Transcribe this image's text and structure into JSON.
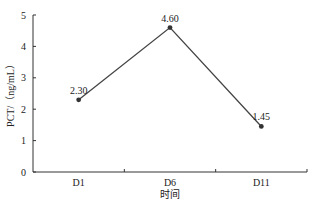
{
  "chart_data": {
    "type": "line",
    "title": "",
    "xlabel": "时间",
    "ylabel": "PCT/（ng/mL）",
    "categories": [
      "D1",
      "D6",
      "D11"
    ],
    "series": [
      {
        "name": "PCT",
        "values": [
          2.3,
          4.6,
          1.45
        ],
        "labels": [
          "2.30",
          "4.60",
          "1.45"
        ],
        "color": "#444444"
      }
    ],
    "ylim": [
      0,
      5
    ],
    "yticks": [
      0,
      1,
      2,
      3,
      4,
      5
    ],
    "ytick_labels": [
      "0",
      "1",
      "2",
      "3",
      "4",
      "5"
    ],
    "grid": false,
    "legend": null
  }
}
